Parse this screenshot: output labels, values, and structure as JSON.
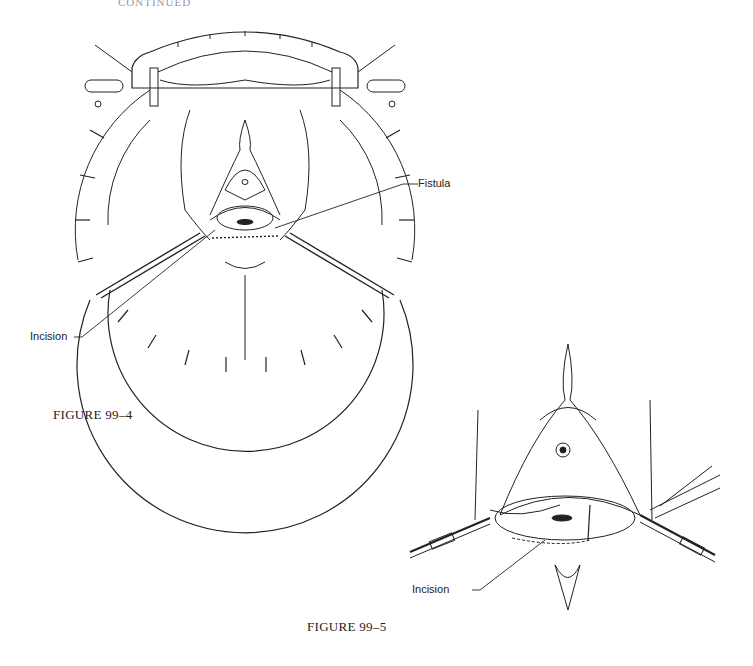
{
  "page": {
    "header_fragment": "CONTINUED"
  },
  "figures": [
    {
      "id": "fig-99-4",
      "caption": "FIGURE 99–4",
      "labels": {
        "fistula": "Fistula",
        "incision": "Incision"
      }
    },
    {
      "id": "fig-99-5",
      "caption": "FIGURE 99–5",
      "labels": {
        "incision": "Incision"
      }
    }
  ],
  "colors": {
    "ink": "#222222",
    "paper": "#ffffff"
  }
}
